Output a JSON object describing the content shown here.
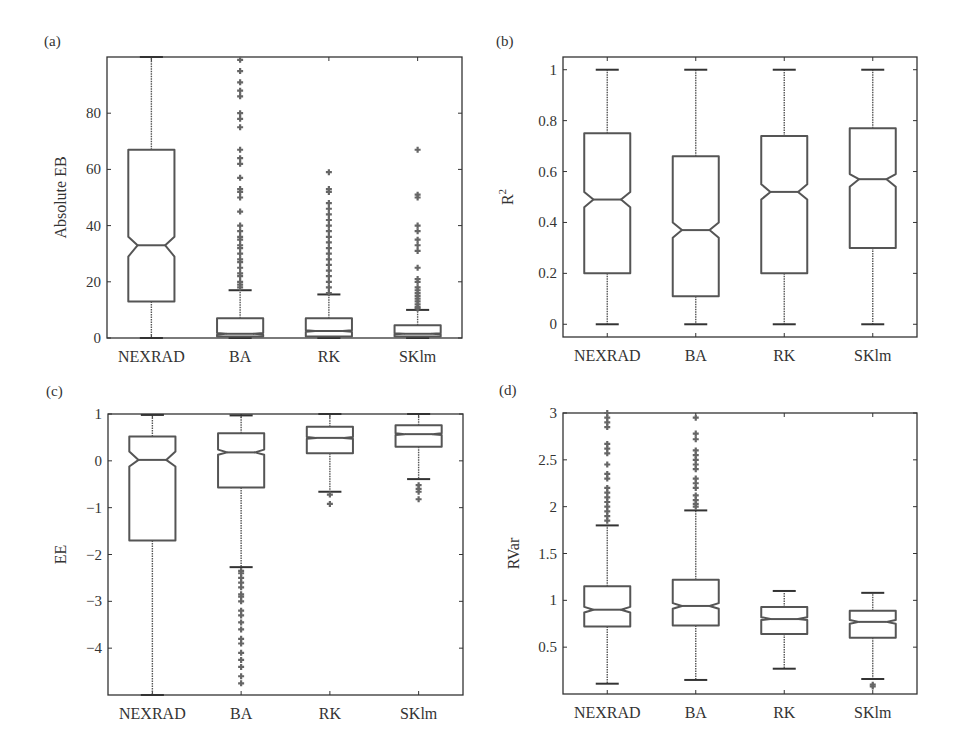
{
  "figure": {
    "background": "#ffffff",
    "box_color": "#555555",
    "outlier_color": "#666666"
  },
  "chart_data": [
    {
      "type": "boxplot",
      "panel_label": "(a)",
      "title": "",
      "xlabel": "",
      "ylabel": "Absolute EB",
      "categories": [
        "NEXRAD",
        "BA",
        "RK",
        "SKlm"
      ],
      "ylim": [
        0,
        100
      ],
      "yticks": [
        0,
        20,
        40,
        60,
        80
      ],
      "ytick_labels": [
        "0",
        "20",
        "40",
        "60",
        "80"
      ],
      "notched": true,
      "grid": false,
      "boxes": [
        {
          "name": "NEXRAD",
          "whisker_low": 0,
          "q1": 13,
          "median": 33,
          "notch_low": 29,
          "notch_high": 36,
          "q3": 67,
          "whisker_high": 100,
          "outliers": []
        },
        {
          "name": "BA",
          "whisker_low": 0,
          "q1": 0.5,
          "median": 1.5,
          "notch_low": 1.2,
          "notch_high": 1.8,
          "q3": 7,
          "whisker_high": 17,
          "outliers": [
            18,
            19,
            20,
            22,
            23,
            25,
            27,
            28,
            30,
            32,
            33,
            35,
            36,
            38,
            40,
            45,
            50,
            52,
            53,
            57,
            62,
            64,
            67,
            75,
            78,
            80,
            86,
            88,
            91,
            95,
            99
          ]
        },
        {
          "name": "RK",
          "whisker_low": 0,
          "q1": 0.5,
          "median": 2.5,
          "notch_low": 2.2,
          "notch_high": 2.8,
          "q3": 7,
          "whisker_high": 15.5,
          "outliers": [
            16,
            18,
            20,
            22,
            24,
            26,
            28,
            30,
            32,
            34,
            36,
            38,
            40,
            42,
            44,
            46,
            48,
            52,
            53,
            59
          ]
        },
        {
          "name": "SKlm",
          "whisker_low": 0,
          "q1": 0.5,
          "median": 1.5,
          "notch_low": 1.3,
          "notch_high": 1.7,
          "q3": 4.5,
          "whisker_high": 10,
          "outliers": [
            10.5,
            11,
            12,
            13,
            14,
            15,
            16,
            17,
            18,
            20,
            21,
            25,
            31,
            33,
            35,
            38,
            40,
            50,
            51,
            67
          ]
        }
      ]
    },
    {
      "type": "boxplot",
      "panel_label": "(b)",
      "title": "",
      "xlabel": "",
      "ylabel": "R²",
      "ylabel_base": "R",
      "ylabel_sup": "2",
      "categories": [
        "NEXRAD",
        "BA",
        "RK",
        "SKlm"
      ],
      "ylim": [
        -0.05,
        1.05
      ],
      "yticks": [
        0,
        0.2,
        0.4,
        0.6,
        0.8,
        1
      ],
      "ytick_labels": [
        "0",
        "0.2",
        "0.4",
        "0.6",
        "0.8",
        "1"
      ],
      "notched": true,
      "grid": false,
      "boxes": [
        {
          "name": "NEXRAD",
          "whisker_low": 0,
          "q1": 0.2,
          "median": 0.49,
          "notch_low": 0.46,
          "notch_high": 0.52,
          "q3": 0.75,
          "whisker_high": 1.0,
          "outliers": []
        },
        {
          "name": "BA",
          "whisker_low": 0,
          "q1": 0.11,
          "median": 0.37,
          "notch_low": 0.34,
          "notch_high": 0.4,
          "q3": 0.66,
          "whisker_high": 1.0,
          "outliers": []
        },
        {
          "name": "RK",
          "whisker_low": 0,
          "q1": 0.2,
          "median": 0.52,
          "notch_low": 0.49,
          "notch_high": 0.55,
          "q3": 0.74,
          "whisker_high": 1.0,
          "outliers": []
        },
        {
          "name": "SKlm",
          "whisker_low": 0,
          "q1": 0.3,
          "median": 0.57,
          "notch_low": 0.54,
          "notch_high": 0.59,
          "q3": 0.77,
          "whisker_high": 1.0,
          "outliers": []
        }
      ]
    },
    {
      "type": "boxplot",
      "panel_label": "(c)",
      "title": "",
      "xlabel": "",
      "ylabel": "EE",
      "categories": [
        "NEXRAD",
        "BA",
        "RK",
        "SKlm"
      ],
      "ylim": [
        -5,
        1
      ],
      "yticks": [
        -4,
        -3,
        -2,
        -1,
        0,
        1
      ],
      "ytick_labels": [
        "−4",
        "−3",
        "−2",
        "−1",
        "0",
        "1"
      ],
      "notched": true,
      "grid": false,
      "boxes": [
        {
          "name": "NEXRAD",
          "whisker_low": -5,
          "q1": -1.7,
          "median": 0.02,
          "notch_low": -0.12,
          "notch_high": 0.2,
          "q3": 0.52,
          "whisker_high": 0.98,
          "outliers": []
        },
        {
          "name": "BA",
          "whisker_low": -2.27,
          "q1": -0.57,
          "median": 0.18,
          "notch_low": 0.13,
          "notch_high": 0.24,
          "q3": 0.59,
          "whisker_high": 0.97,
          "outliers": [
            -2.35,
            -2.4,
            -2.5,
            -2.6,
            -2.7,
            -2.85,
            -2.9,
            -3.0,
            -3.2,
            -3.3,
            -3.45,
            -3.6,
            -3.8,
            -3.9,
            -4.1,
            -4.25,
            -4.4,
            -4.6,
            -4.75
          ]
        },
        {
          "name": "RK",
          "whisker_low": -0.66,
          "q1": 0.16,
          "median": 0.49,
          "notch_low": 0.47,
          "notch_high": 0.51,
          "q3": 0.73,
          "whisker_high": 1.0,
          "outliers": [
            -0.72,
            -0.92
          ]
        },
        {
          "name": "SKlm",
          "whisker_low": -0.39,
          "q1": 0.3,
          "median": 0.57,
          "notch_low": 0.55,
          "notch_high": 0.59,
          "q3": 0.76,
          "whisker_high": 1.0,
          "outliers": [
            -0.52,
            -0.6,
            -0.66,
            -0.82
          ]
        }
      ]
    },
    {
      "type": "boxplot",
      "panel_label": "(d)",
      "title": "",
      "xlabel": "",
      "ylabel": "RVar",
      "categories": [
        "NEXRAD",
        "BA",
        "RK",
        "SKlm"
      ],
      "ylim": [
        0,
        3
      ],
      "yticks": [
        0.5,
        1,
        1.5,
        2,
        2.5,
        3
      ],
      "ytick_labels": [
        "0.5",
        "1",
        "1.5",
        "2",
        "2.5",
        "3"
      ],
      "notched": true,
      "grid": false,
      "boxes": [
        {
          "name": "NEXRAD",
          "whisker_low": 0.11,
          "q1": 0.72,
          "median": 0.9,
          "notch_low": 0.87,
          "notch_high": 0.93,
          "q3": 1.15,
          "whisker_high": 1.8,
          "outliers": [
            1.85,
            1.9,
            1.95,
            2.0,
            2.05,
            2.1,
            2.15,
            2.2,
            2.3,
            2.35,
            2.45,
            2.57,
            2.62,
            2.67,
            2.85,
            2.9,
            2.95,
            3.0
          ]
        },
        {
          "name": "BA",
          "whisker_low": 0.15,
          "q1": 0.73,
          "median": 0.94,
          "notch_low": 0.91,
          "notch_high": 0.97,
          "q3": 1.22,
          "whisker_high": 1.96,
          "outliers": [
            2.0,
            2.03,
            2.07,
            2.12,
            2.2,
            2.25,
            2.3,
            2.4,
            2.45,
            2.5,
            2.55,
            2.6,
            2.72,
            2.78,
            2.95
          ]
        },
        {
          "name": "RK",
          "whisker_low": 0.27,
          "q1": 0.64,
          "median": 0.8,
          "notch_low": 0.79,
          "notch_high": 0.82,
          "q3": 0.93,
          "whisker_high": 1.1,
          "outliers": []
        },
        {
          "name": "SKlm",
          "whisker_low": 0.16,
          "q1": 0.6,
          "median": 0.77,
          "notch_low": 0.75,
          "notch_high": 0.79,
          "q3": 0.89,
          "whisker_high": 1.08,
          "outliers": [
            0.1,
            0.08
          ]
        }
      ]
    }
  ]
}
